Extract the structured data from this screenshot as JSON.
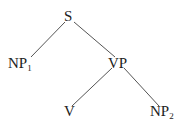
{
  "diagram": {
    "type": "syntax-tree",
    "nodes": {
      "root": {
        "label": "S",
        "sub": ""
      },
      "np1": {
        "label": "NP",
        "sub": "1"
      },
      "vp": {
        "label": "VP",
        "sub": ""
      },
      "v": {
        "label": "V",
        "sub": ""
      },
      "np2": {
        "label": "NP",
        "sub": "2"
      }
    },
    "edges": [
      [
        "S",
        "NP1"
      ],
      [
        "S",
        "VP"
      ],
      [
        "VP",
        "V"
      ],
      [
        "VP",
        "NP2"
      ]
    ],
    "colors": {
      "line": "#555555",
      "text": "#222222",
      "background": "#ffffff"
    }
  }
}
